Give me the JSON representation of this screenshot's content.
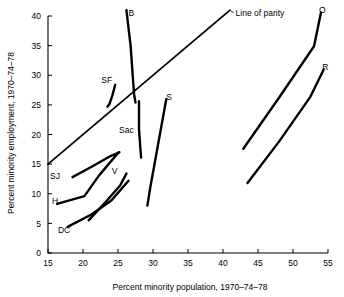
{
  "chart_data": {
    "type": "line",
    "title": "",
    "xlabel": "Percent minority population, 1970–74–78",
    "ylabel": "Percent minority employment, 1970–74–78",
    "xlim": [
      15,
      55
    ],
    "ylim": [
      0,
      41
    ],
    "xticks": [
      15,
      20,
      25,
      30,
      35,
      40,
      45,
      50,
      55
    ],
    "yticks": [
      0,
      5,
      10,
      15,
      20,
      25,
      30,
      35,
      40
    ],
    "xtick_labels": [
      "15",
      "20",
      "25",
      "30",
      "35",
      "40",
      "45",
      "50",
      "55"
    ],
    "ytick_labels": [
      "0",
      "5",
      "10",
      "15",
      "20",
      "25",
      "30",
      "35",
      "40"
    ],
    "grid": false,
    "legend": "none",
    "annotations": [
      {
        "name": "line-of-parity",
        "text": "Line of parity",
        "x": 41.0,
        "y": 41.0,
        "label_x": 41.8,
        "label_y": 40.6
      }
    ],
    "reference_lines": [
      {
        "name": "line-of-parity",
        "points": [
          [
            15,
            15
          ],
          [
            41,
            41
          ]
        ]
      }
    ],
    "series": [
      {
        "name": "B",
        "label": "B",
        "label_x": 26.9,
        "label_y": 40.6,
        "points": [
          [
            26.2,
            41.0
          ],
          [
            26.8,
            35.0
          ],
          [
            27.1,
            30.0
          ],
          [
            27.3,
            26.8
          ],
          [
            27.5,
            25.4
          ]
        ]
      },
      {
        "name": "SF",
        "label": "SF",
        "label_x": 23.4,
        "label_y": 29.3,
        "points": [
          [
            24.6,
            28.4
          ],
          [
            24.2,
            26.6
          ],
          [
            23.8,
            25.2
          ],
          [
            23.5,
            24.7
          ]
        ]
      },
      {
        "name": "Sac",
        "label": "Sac",
        "label_x": 26.2,
        "label_y": 20.8,
        "points": [
          [
            28.0,
            25.6
          ],
          [
            28.0,
            21.0
          ],
          [
            28.2,
            17.6
          ],
          [
            28.3,
            16.1
          ]
        ]
      },
      {
        "name": "S",
        "label": "S",
        "label_x": 32.3,
        "label_y": 26.4,
        "points": [
          [
            31.9,
            26.0
          ],
          [
            30.6,
            17.5
          ],
          [
            29.6,
            11.0
          ],
          [
            29.2,
            8.0
          ]
        ]
      },
      {
        "name": "SJ",
        "label": "SJ",
        "label_x": 16.0,
        "label_y": 13.0,
        "points": [
          [
            18.5,
            12.8
          ],
          [
            21.3,
            14.6
          ],
          [
            24.0,
            16.4
          ],
          [
            25.2,
            17.0
          ]
        ]
      },
      {
        "name": "H",
        "label": "H",
        "label_x": 16.0,
        "label_y": 8.8,
        "points": [
          [
            16.3,
            8.3
          ],
          [
            20.2,
            9.6
          ],
          [
            22.3,
            13.1
          ],
          [
            25.1,
            17.0
          ]
        ]
      },
      {
        "name": "V",
        "label": "V",
        "label_x": 24.5,
        "label_y": 13.8,
        "points": [
          [
            20.8,
            5.5
          ],
          [
            23.3,
            8.7
          ],
          [
            25.3,
            11.4
          ],
          [
            26.2,
            13.4
          ]
        ]
      },
      {
        "name": "DC",
        "label": "DC",
        "label_x": 17.3,
        "label_y": 3.9,
        "points": [
          [
            17.8,
            4.4
          ],
          [
            21.2,
            6.5
          ],
          [
            24.0,
            8.8
          ],
          [
            26.5,
            12.2
          ]
        ]
      },
      {
        "name": "O",
        "label": "O",
        "label_x": 54.2,
        "label_y": 41.0,
        "points": [
          [
            42.9,
            17.6
          ],
          [
            48.0,
            26.2
          ],
          [
            53.0,
            34.9
          ],
          [
            54.0,
            40.6
          ]
        ]
      },
      {
        "name": "R",
        "label": "R",
        "label_x": 54.6,
        "label_y": 31.5,
        "points": [
          [
            43.5,
            11.8
          ],
          [
            48.0,
            18.8
          ],
          [
            52.5,
            26.4
          ],
          [
            54.4,
            31.0
          ]
        ]
      }
    ]
  }
}
